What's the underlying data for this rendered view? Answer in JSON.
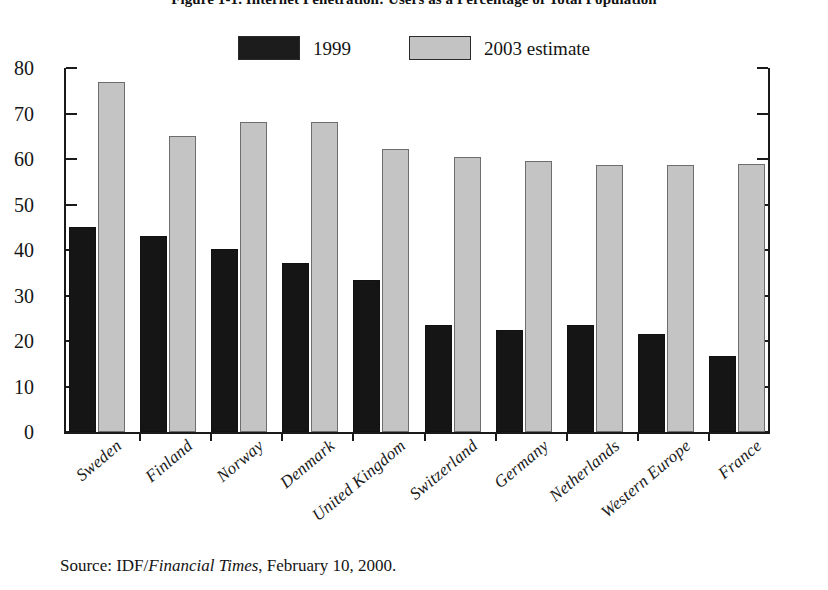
{
  "figure": {
    "title": "Figure 1-1. Internet Penetration: Users as a Percentage of Total Population",
    "source_prefix": "Source:  IDF/",
    "source_italic": "Financial Times",
    "source_suffix": ", February 10, 2000."
  },
  "legend": {
    "entries": [
      {
        "label": "1999",
        "swatch": "dark-swatch",
        "color": "#1c1c1c"
      },
      {
        "label": "2003 estimate",
        "swatch": "light-swatch",
        "color": "#c3c3c3"
      }
    ]
  },
  "axis": {
    "y_ticks": [
      "0",
      "10",
      "20",
      "30",
      "40",
      "50",
      "60",
      "70",
      "80"
    ]
  },
  "chart_data": {
    "type": "bar",
    "title": "Figure 1-1. Internet Penetration: Users as a Percentage of Total Population",
    "xlabel": "",
    "ylabel": "",
    "ylim": [
      0,
      80
    ],
    "ytick_step": 10,
    "grid": false,
    "legend_position": "top-center",
    "categories": [
      "Sweden",
      "Finland",
      "Norway",
      "Denmark",
      "United Kingdom",
      "Switzerland",
      "Germany",
      "Netherlands",
      "Western Europe",
      "France"
    ],
    "series": [
      {
        "name": "1999",
        "color": "#151515",
        "values": [
          45.0,
          43.0,
          40.2,
          37.2,
          33.4,
          23.5,
          22.5,
          23.5,
          21.6,
          16.6
        ]
      },
      {
        "name": "2003 estimate",
        "color": "#c4c4c4",
        "values": [
          77.0,
          65.0,
          68.2,
          68.2,
          62.3,
          60.5,
          59.6,
          58.6,
          58.7,
          58.9
        ]
      }
    ],
    "source": "Source:  IDF/Financial Times, February 10, 2000."
  }
}
